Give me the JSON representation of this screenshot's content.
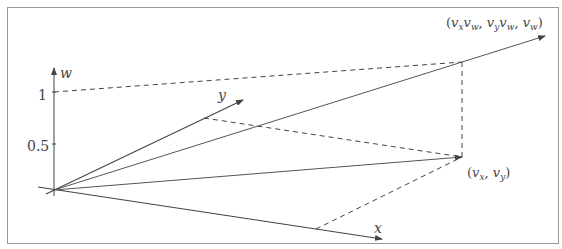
{
  "diagram": {
    "axes": {
      "w": {
        "label": "w"
      },
      "x": {
        "label": "x"
      },
      "y": {
        "label": "y"
      }
    },
    "ticks": [
      {
        "label": "1",
        "value": 1
      },
      {
        "label": "0.5",
        "value": 0.5
      }
    ],
    "points": {
      "projected": {
        "label": "(v_x, v_y)",
        "display_main": "(v",
        "sub_x": "x",
        "comma": ", v",
        "sub_y": "y",
        "close": ")"
      },
      "homogeneous": {
        "label": "(v_x v_w, v_y v_w, v_w)"
      }
    },
    "colors": {
      "stroke": "#555555",
      "frame": "#999999",
      "text": "#444444"
    }
  }
}
